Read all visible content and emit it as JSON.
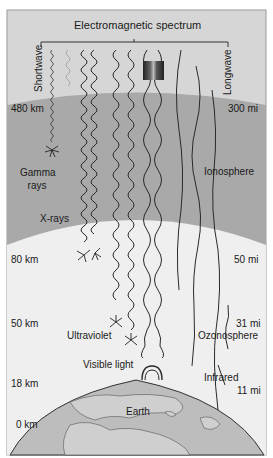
{
  "title": "Electromagnetic spectrum",
  "spectrum_ends": {
    "short": "Shortwave",
    "long": "Longwave"
  },
  "altitudes_left": [
    "480 km",
    "80 km",
    "50 km",
    "18 km",
    "0 km"
  ],
  "altitudes_right": [
    "300 mi",
    "50 mi",
    "31 mi",
    "11 mi"
  ],
  "layers": {
    "ionosphere": "Ionosphere",
    "ozonosphere": "Ozonosphere",
    "earth": "Earth"
  },
  "radiation": {
    "gamma": "Gamma rays",
    "gamma_line1": "Gamma",
    "gamma_line2": "rays",
    "xrays": "X-rays",
    "ultraviolet": "Ultraviolet",
    "visible": "Visible light",
    "infrared": "Infrared"
  },
  "colors": {
    "frame": "#9a9a9a",
    "sky_top": "#d8d8d8",
    "ionosphere": "#a8a8a8",
    "lower_atmosphere": "#f0f0f0",
    "earth": "#bdbdbd",
    "land": "#cfcfcf",
    "wave": "#2a2a2a"
  }
}
